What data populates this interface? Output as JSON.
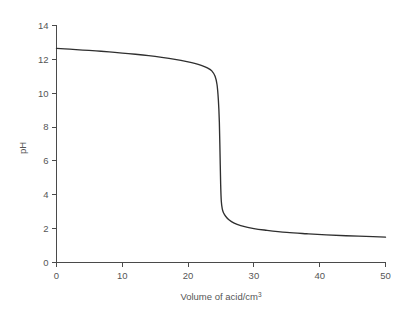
{
  "chart_data": {
    "type": "line",
    "title": "",
    "subtitle": "",
    "xlabel": "Volume of acid/cm",
    "xlabel_superscript": "3",
    "xlabel_full": "Volume of acid/cm3",
    "ylabel": "pH",
    "xlim": [
      0,
      50
    ],
    "ylim": [
      0,
      14
    ],
    "xticks": [
      0,
      10,
      20,
      30,
      40,
      50
    ],
    "yticks": [
      0,
      2,
      4,
      6,
      8,
      10,
      12,
      14
    ],
    "xtick_labels": [
      "0",
      "10",
      "20",
      "30",
      "40",
      "50"
    ],
    "ytick_labels": [
      "0",
      "2",
      "4",
      "6",
      "8",
      "10",
      "12",
      "14"
    ],
    "grid": false,
    "legend": false,
    "legend_position": "none",
    "curve_color": "#2f2f2f",
    "axis_color": "#4a4a4a",
    "text_color": "#565656",
    "background_color": "#ffffff",
    "series": [
      {
        "name": "Titration curve: strong base titrated with acid",
        "color": "#2f2f2f",
        "x": [
          0,
          2,
          4,
          6,
          8,
          10,
          12,
          14,
          16,
          18,
          20,
          21,
          22,
          23,
          23.6,
          24.1,
          24.4,
          24.6,
          24.75,
          24.85,
          24.95,
          25.05,
          25.2,
          25.4,
          25.7,
          26.2,
          27,
          28,
          30,
          32,
          35,
          38,
          41,
          44,
          47,
          50
        ],
        "y": [
          12.65,
          12.6,
          12.55,
          12.5,
          12.44,
          12.37,
          12.3,
          12.22,
          12.12,
          12.0,
          11.85,
          11.76,
          11.64,
          11.48,
          11.32,
          11.0,
          10.5,
          9.6,
          8.3,
          6.5,
          4.6,
          3.6,
          3.15,
          2.92,
          2.73,
          2.52,
          2.32,
          2.18,
          2.0,
          1.9,
          1.78,
          1.7,
          1.63,
          1.58,
          1.54,
          1.5
        ]
      }
    ],
    "annotations": [],
    "equivalence_point": {
      "x": 25,
      "ph": 7
    }
  }
}
